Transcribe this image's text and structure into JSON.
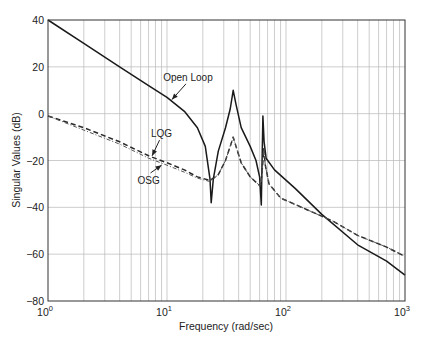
{
  "chart_data": {
    "type": "line",
    "title": "",
    "xlabel": "Frequency (rad/sec)",
    "ylabel": "Singular Values (dB)",
    "xscale": "log",
    "xlim": [
      1,
      1000
    ],
    "ylim": [
      -80,
      40
    ],
    "grid": true,
    "x_ticks": [
      {
        "value": 1,
        "base": "10",
        "exp": "0"
      },
      {
        "value": 10,
        "base": "10",
        "exp": "1"
      },
      {
        "value": 100,
        "base": "10",
        "exp": "2"
      },
      {
        "value": 1000,
        "base": "10",
        "exp": "3"
      }
    ],
    "y_ticks": [
      40,
      20,
      0,
      -20,
      -40,
      -60,
      -80
    ],
    "y_tick_labels": [
      "40",
      "20",
      "0",
      "−20",
      "−40",
      "−60",
      "−80"
    ],
    "series": [
      {
        "name": "Open Loop",
        "style": "solid",
        "points": [
          [
            1,
            40
          ],
          [
            2,
            30
          ],
          [
            4,
            20
          ],
          [
            7,
            12
          ],
          [
            10,
            7
          ],
          [
            14,
            1
          ],
          [
            18,
            -6
          ],
          [
            21,
            -14
          ],
          [
            23,
            -28
          ],
          [
            23.5,
            -38
          ],
          [
            24.5,
            -28
          ],
          [
            27,
            -16
          ],
          [
            31,
            -6
          ],
          [
            34,
            2
          ],
          [
            36,
            10
          ],
          [
            38,
            4
          ],
          [
            42,
            -6
          ],
          [
            50,
            -14
          ],
          [
            56,
            -20
          ],
          [
            60,
            -27
          ],
          [
            62,
            -39
          ],
          [
            63,
            -20
          ],
          [
            64,
            -1
          ],
          [
            65.5,
            -12
          ],
          [
            68,
            -19
          ],
          [
            80,
            -24
          ],
          [
            120,
            -32
          ],
          [
            200,
            -43
          ],
          [
            400,
            -56
          ],
          [
            700,
            -63
          ],
          [
            1000,
            -69
          ]
        ]
      },
      {
        "name": "LQG",
        "style": "dashed",
        "points": [
          [
            1,
            -1
          ],
          [
            2,
            -6
          ],
          [
            4,
            -12
          ],
          [
            7,
            -18
          ],
          [
            10,
            -21
          ],
          [
            14,
            -24
          ],
          [
            18,
            -27
          ],
          [
            23,
            -28.5
          ],
          [
            27,
            -26
          ],
          [
            31,
            -20
          ],
          [
            34,
            -14
          ],
          [
            36,
            -10
          ],
          [
            38,
            -14
          ],
          [
            42,
            -21
          ],
          [
            50,
            -27
          ],
          [
            58,
            -30
          ],
          [
            61,
            -31
          ],
          [
            63,
            -25
          ],
          [
            65,
            -15
          ],
          [
            67,
            -22
          ],
          [
            72,
            -30
          ],
          [
            90,
            -36
          ],
          [
            150,
            -41
          ],
          [
            250,
            -46
          ],
          [
            400,
            -52
          ],
          [
            700,
            -57
          ],
          [
            1000,
            -61
          ]
        ]
      },
      {
        "name": "OSG",
        "style": "dash-dot",
        "points": [
          [
            1,
            -1
          ],
          [
            2,
            -7
          ],
          [
            4,
            -13
          ],
          [
            7,
            -19
          ],
          [
            10,
            -22
          ],
          [
            14,
            -25
          ],
          [
            18,
            -27.5
          ],
          [
            23,
            -29
          ],
          [
            27,
            -26
          ],
          [
            31,
            -20
          ],
          [
            34,
            -14
          ],
          [
            36,
            -10
          ],
          [
            38,
            -14
          ],
          [
            42,
            -21
          ],
          [
            50,
            -27
          ],
          [
            58,
            -30
          ],
          [
            61,
            -31
          ],
          [
            63,
            -25
          ],
          [
            65,
            -15
          ],
          [
            67,
            -22
          ],
          [
            72,
            -30
          ],
          [
            90,
            -36
          ],
          [
            150,
            -41
          ],
          [
            250,
            -46
          ],
          [
            400,
            -52
          ],
          [
            700,
            -57
          ],
          [
            1000,
            -61
          ]
        ]
      }
    ],
    "annotations": [
      {
        "text": "Open Loop",
        "label_at": [
          15,
          14
        ],
        "arrow_to": [
          11,
          6
        ]
      },
      {
        "text": "LQG",
        "label_at": [
          9,
          -10
        ],
        "arrow_to": [
          7.5,
          -18
        ]
      },
      {
        "text": "OSG",
        "label_at": [
          7,
          -30
        ],
        "arrow_to": [
          9,
          -22
        ]
      }
    ]
  }
}
